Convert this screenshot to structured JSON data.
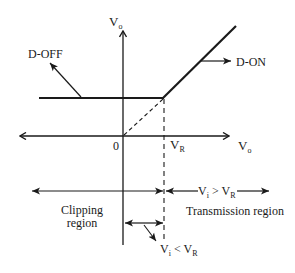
{
  "diagram": {
    "type": "transfer-characteristic",
    "colors": {
      "line": "#1a1a1a",
      "background": "#ffffff"
    },
    "axes": {
      "y_label": {
        "main": "V",
        "sub": "o"
      },
      "x_label": {
        "main": "V",
        "sub": "o"
      },
      "origin_label": "0",
      "vr_label": {
        "main": "V",
        "sub": "R"
      }
    },
    "curve_labels": {
      "d_off": "D-OFF",
      "d_on": "D-ON"
    },
    "regions": {
      "clipping": {
        "line1": "Clipping",
        "line2": "region"
      },
      "transmission": "Transmission region",
      "vi_gt_vr": {
        "v1": "V",
        "s1": "i",
        "op": " > ",
        "v2": "V",
        "s2": "R"
      },
      "vi_lt_vr": {
        "v1": "V",
        "s1": "i",
        "op": " < ",
        "v2": "V",
        "s2": "R"
      }
    }
  }
}
